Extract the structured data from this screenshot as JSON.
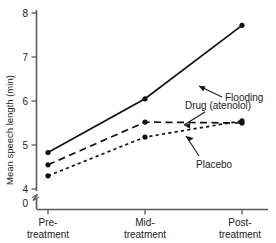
{
  "chart_data": {
    "type": "line",
    "title": "",
    "xlabel": "",
    "ylabel": "Mean speech length (min)",
    "categories": [
      "Pre-treatment",
      "Mid-treatment",
      "Post-treatment"
    ],
    "category_lines": [
      [
        "Pre-",
        "treatment"
      ],
      [
        "Mid-",
        "treatment"
      ],
      [
        "Post-",
        "treatment"
      ]
    ],
    "ylim": [
      4,
      8
    ],
    "yticks": [
      4,
      5,
      6,
      7,
      8
    ],
    "ytick_labels": [
      "4",
      "5",
      "6",
      "7",
      "8"
    ],
    "y_origin_label": "0",
    "y_axis_broken": true,
    "grid": false,
    "legend_position": "inline-annotations",
    "series": [
      {
        "name": "Flooding",
        "style": "solid",
        "values": [
          4.83,
          6.05,
          7.72
        ]
      },
      {
        "name": "Drug (atenolol)",
        "style": "longdash",
        "values": [
          4.55,
          5.52,
          5.5
        ]
      },
      {
        "name": "Placebo",
        "style": "shortdash",
        "values": [
          4.3,
          5.18,
          5.55
        ]
      }
    ],
    "annotations": [
      {
        "text": "Flooding",
        "series": "Flooding"
      },
      {
        "text": "Drug (atenolol)",
        "series": "Drug (atenolol)"
      },
      {
        "text": "Placebo",
        "series": "Placebo"
      }
    ]
  }
}
